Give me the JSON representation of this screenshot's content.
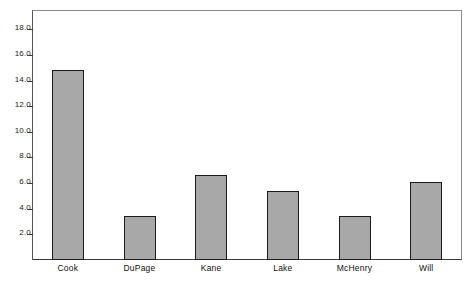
{
  "chart_data": {
    "type": "bar",
    "title": "",
    "subtitle": "",
    "xlabel": "",
    "ylabel": "",
    "categories": [
      "Cook",
      "DuPage",
      "Kane",
      "Lake",
      "McHenry",
      "Will"
    ],
    "values": [
      14.8,
      3.4,
      6.6,
      5.4,
      3.4,
      6.1
    ],
    "series": [
      {
        "name": "",
        "values": [
          14.8,
          3.4,
          6.6,
          5.4,
          3.4,
          6.1
        ]
      }
    ],
    "ylim": [
      0,
      19.5
    ],
    "xlim": [
      0,
      6
    ],
    "y_ticks": [
      2.0,
      4.0,
      6.0,
      8.0,
      10.0,
      12.0,
      14.0,
      16.0,
      18.0
    ],
    "y_tick_labels": [
      "2.0",
      "4.0",
      "6.0",
      "8.0",
      "10.0",
      "12.0",
      "14.0",
      "16.0",
      "18.0"
    ],
    "grid": false,
    "legend": false,
    "legend_position": "none",
    "bar_fill_color": "#a8a8a8",
    "bar_edge_color": "#1c1c1c",
    "frame_color": "#555555",
    "background_color": "#ffffff",
    "text_color": "#111111"
  }
}
